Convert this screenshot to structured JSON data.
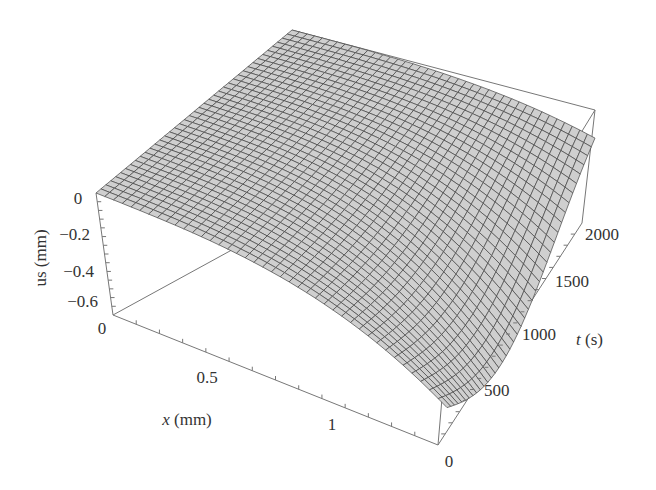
{
  "chart_data": {
    "type": "surface3d",
    "title": "",
    "xlabel": "x (mm)",
    "ylabel": "t (s)",
    "zlabel": "us (mm)",
    "x_ticks": [
      "0",
      "0.5",
      "1"
    ],
    "t_ticks": [
      "0",
      "500",
      "1000",
      "1500",
      "2000"
    ],
    "z_ticks": [
      "0",
      "-0.2",
      "-0.4",
      "-0.6"
    ],
    "x_range": [
      0,
      1.4
    ],
    "t_range": [
      0,
      2000
    ],
    "z_range": [
      -0.7,
      0
    ],
    "grid": false,
    "surface_description": "Mesh surface of surface displacement us(x,t); zero at x=0, decreasing with x and with t, reaching about -0.65 mm near x=1.4 mm, t≈1000 s",
    "mesh_color": "#cfcfcf",
    "mesh_line_color": "#444444",
    "samples": {
      "x": [
        0,
        0.35,
        0.7,
        1.05,
        1.4
      ],
      "t": [
        0,
        500,
        1000,
        1500,
        2000
      ],
      "us": [
        [
          0,
          0,
          0,
          0,
          0
        ],
        [
          -0.02,
          -0.05,
          -0.08,
          -0.07,
          -0.05
        ],
        [
          -0.05,
          -0.12,
          -0.18,
          -0.16,
          -0.12
        ],
        [
          -0.1,
          -0.25,
          -0.35,
          -0.3,
          -0.22
        ],
        [
          -0.2,
          -0.5,
          -0.65,
          -0.5,
          -0.35
        ]
      ]
    }
  },
  "labels": {
    "z_label": "us (mm)",
    "x_label_var": "x",
    "x_label_unit": " (mm)",
    "t_label_var": "t",
    "t_label_unit": " (s)",
    "z_ticks": [
      "0",
      "−0.2",
      "−0.4",
      "−0.6"
    ],
    "z_base": "0",
    "x_ticks": [
      "0.5",
      "1"
    ],
    "t_ticks": [
      "0",
      "500",
      "1000",
      "1500",
      "2000"
    ]
  }
}
